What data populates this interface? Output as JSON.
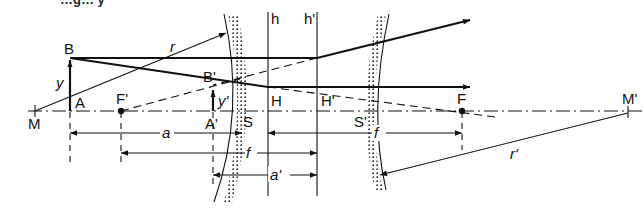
{
  "figure": {
    "title_fragment": "…g… y"
  },
  "labels": {
    "M": "M",
    "A": "A",
    "B": "B",
    "y": "y",
    "r": "r",
    "F_prime": "F'",
    "B_prime": "B'",
    "A_prime": "A'",
    "y_prime": "y'",
    "S": "S",
    "H": "H",
    "h": "h",
    "h_prime": "h'",
    "H_prime": "H'",
    "S_prime": "S'",
    "F": "F",
    "M_prime": "M'",
    "r_prime": "r'"
  },
  "dimensions": {
    "a": "a",
    "f_left": "f",
    "f_right": "f",
    "a_prime": "a'"
  }
}
